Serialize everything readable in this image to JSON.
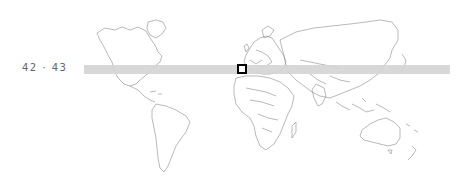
{
  "label": {
    "text": "42 · 43"
  },
  "band": {
    "color": "#d4d4d4",
    "from_lat": 42,
    "to_lat": 43
  },
  "marker": {
    "border": "#000000",
    "fill": "#ffffff"
  },
  "map": {
    "outline_color": "#888888",
    "projection": "equirectangular-like world map"
  }
}
